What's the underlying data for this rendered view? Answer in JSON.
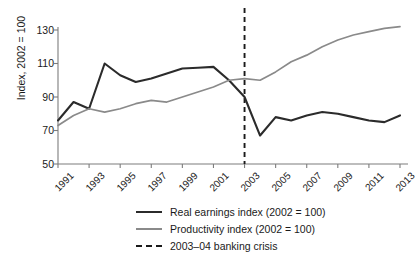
{
  "chart_data": {
    "type": "line",
    "title": "",
    "xlabel": "",
    "ylabel": "Index, 2002 = 100",
    "xlim": [
      1991,
      2013
    ],
    "ylim": [
      50,
      130
    ],
    "yticks": [
      50,
      70,
      90,
      110,
      130
    ],
    "xticks": [
      1991,
      1993,
      1995,
      1997,
      1999,
      2001,
      2003,
      2005,
      2007,
      2009,
      2011,
      2013
    ],
    "grid": false,
    "legend_position": "bottom",
    "x": [
      1991,
      1992,
      1993,
      1994,
      1995,
      1996,
      1997,
      1998,
      1999,
      2000,
      2001,
      2002,
      2003,
      2004,
      2005,
      2006,
      2007,
      2008,
      2009,
      2010,
      2011,
      2012,
      2013
    ],
    "series": [
      {
        "name": "Real earnings index (2002 = 100)",
        "color": "#2b2b2b",
        "style": "solid",
        "values": [
          76,
          87,
          83,
          110,
          103,
          99,
          101,
          104,
          107,
          107.5,
          108,
          100,
          90,
          67,
          78,
          76,
          79,
          81,
          80,
          78,
          76,
          75,
          79
        ]
      },
      {
        "name": "Productivity index (2002 = 100)",
        "color": "#8a8a8a",
        "style": "solid",
        "values": [
          73,
          79,
          83,
          81,
          83,
          86,
          88,
          87,
          90,
          93,
          96,
          100,
          101,
          100,
          105,
          111,
          115,
          120,
          124,
          127,
          129,
          131,
          132
        ]
      }
    ],
    "annotations": [
      {
        "name": "2003–04 banking crisis",
        "type": "vline",
        "x": 2003,
        "style": "dashed",
        "color": "#1a1a1a"
      }
    ]
  },
  "legend": {
    "items": [
      {
        "label": "Real earnings index (2002 = 100)",
        "swatch": "solid-dark"
      },
      {
        "label": "Productivity index (2002 = 100)",
        "swatch": "solid-gray"
      },
      {
        "label": "2003–04 banking crisis",
        "swatch": "dashed-dark"
      }
    ]
  },
  "axis": {
    "y_title": "Index, 2002 = 100",
    "y_tick_labels": [
      "130",
      "110",
      "90",
      "70",
      "50"
    ],
    "x_tick_labels": [
      "1991",
      "1993",
      "1995",
      "1997",
      "1999",
      "2001",
      "2003",
      "2005",
      "2007",
      "2009",
      "2011",
      "2013"
    ]
  },
  "colors": {
    "earnings": "#2b2b2b",
    "productivity": "#8a8a8a",
    "crisis": "#1a1a1a",
    "axis": "#7d7d7d",
    "background": "#ffffff"
  }
}
